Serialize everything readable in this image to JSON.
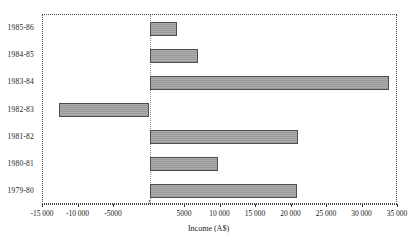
{
  "chart_data": {
    "type": "bar",
    "orientation": "horizontal",
    "title": "",
    "xlabel": "Income (A$)",
    "ylabel": "",
    "categories": [
      "1985-86",
      "1984-85",
      "1983-84",
      "1982-83",
      "1981-82",
      "1980-81",
      "1979-80"
    ],
    "values": [
      3900,
      6900,
      33700,
      -12750,
      20900,
      9600,
      20800
    ],
    "series": [
      {
        "name": "Income (A$)",
        "values": [
          3900,
          6900,
          33700,
          -12750,
          20900,
          9600,
          20800
        ]
      }
    ],
    "xlim": [
      -15000,
      35000
    ],
    "xticks": [
      -15000,
      -10000,
      -5000,
      0,
      5000,
      10000,
      15000,
      20000,
      25000,
      30000,
      35000
    ],
    "xtick_labels": [
      "-15 000",
      "-10 000",
      "-5000",
      "",
      "5000",
      "10 000",
      "15 000",
      "20 000",
      "25 000",
      "30 000",
      "35 000"
    ],
    "grid": false,
    "legend": "none",
    "zero_reference_line": true,
    "bar_fill_color": "#9a9a9a",
    "bar_border_color": "#4d4d4d",
    "frame_color": "#4a4a4a",
    "background_color": "#ffffff"
  }
}
